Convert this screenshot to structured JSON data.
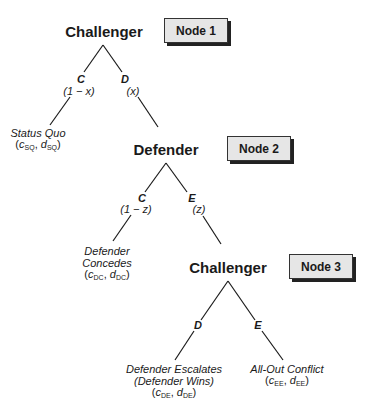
{
  "diagram": {
    "type": "game-tree",
    "nodes": [
      {
        "id": "node1",
        "player": "Challenger",
        "box_label": "Node 1",
        "branches": [
          {
            "move": "C",
            "prob": "(1 − x)",
            "leaf": {
              "lines": [
                "Status Quo"
              ],
              "payoff": {
                "c_sub": "SQ",
                "d_sub": "SQ"
              }
            }
          },
          {
            "move": "D",
            "prob": "(x)",
            "to": "node2"
          }
        ]
      },
      {
        "id": "node2",
        "player": "Defender",
        "box_label": "Node 2",
        "branches": [
          {
            "move": "C",
            "prob": "(1 − z)",
            "leaf": {
              "lines": [
                "Defender",
                "Concedes"
              ],
              "payoff": {
                "c_sub": "DC",
                "d_sub": "DC"
              }
            }
          },
          {
            "move": "E",
            "prob": "(z)",
            "to": "node3"
          }
        ]
      },
      {
        "id": "node3",
        "player": "Challenger",
        "box_label": "Node 3",
        "branches": [
          {
            "move": "D",
            "leaf": {
              "lines": [
                "Defender Escalates",
                "(Defender Wins)"
              ],
              "payoff": {
                "c_sub": "DE",
                "d_sub": "DE"
              }
            }
          },
          {
            "move": "E",
            "leaf": {
              "lines": [
                "All-Out Conflict"
              ],
              "payoff": {
                "c_sub": "EE",
                "d_sub": "EE"
              }
            }
          }
        ]
      }
    ],
    "payoff_symbols": {
      "c": "c",
      "d": "d"
    },
    "colors": {
      "line": "#1a1a1a",
      "box_fill": "#e6e6e6",
      "box_shadow": "#222222",
      "text": "#1a1a1a"
    }
  }
}
